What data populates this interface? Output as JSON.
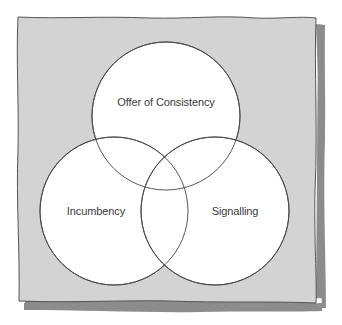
{
  "diagram": {
    "type": "venn",
    "colors": {
      "background": "#ffffff",
      "panel_fill": "#d3d3d3",
      "panel_stroke": "#555555",
      "shadow": "#8c8c8c",
      "circle_fill": "#ffffff",
      "circle_stroke": "#444444",
      "label_text": "#3a3a3a"
    },
    "circles": [
      {
        "id": "top",
        "label": "Offer of Consistency",
        "cx": 166,
        "cy": 116,
        "r": 74
      },
      {
        "id": "left",
        "label": "Incumbency",
        "cx": 114,
        "cy": 211,
        "r": 74
      },
      {
        "id": "right",
        "label": "Signalling",
        "cx": 215,
        "cy": 211,
        "r": 74
      }
    ]
  },
  "labels": {
    "top": "Offer of Consistency",
    "left": "Incumbency",
    "right": "Signalling"
  }
}
